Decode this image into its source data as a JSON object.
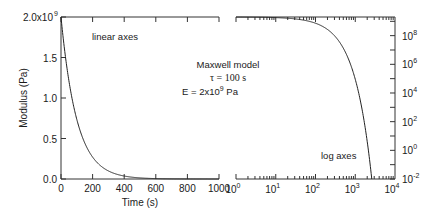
{
  "chart_data": [
    {
      "type": "line",
      "name": "linear-panel",
      "title": "",
      "xlabel": "Time (s)",
      "ylabel": "Modulus (Pa)",
      "xlim": [
        0,
        1000
      ],
      "ylim": [
        0,
        2000000000.0
      ],
      "xscale": "linear",
      "yscale": "linear",
      "x_ticks": [
        0,
        200,
        400,
        600,
        800,
        1000
      ],
      "x_tick_labels": [
        "0",
        "200",
        "400",
        "600",
        "800",
        "1000"
      ],
      "y_ticks": [
        0,
        500000000.0,
        1000000000.0,
        1500000000.0,
        2000000000.0
      ],
      "y_tick_labels": [
        "0.0",
        "0.5",
        "1.0",
        "1.5",
        "2.0x10"
      ],
      "y_top_label_exponent": "9",
      "annotation": "linear axes",
      "series": [
        {
          "name": "E(t) = E exp(-t/tau)",
          "function": "exponential_decay",
          "E": 2000000000.0,
          "tau": 100
        }
      ]
    },
    {
      "type": "line",
      "name": "log-panel",
      "xlabel": "",
      "ylabel": "",
      "xlim": [
        1,
        10000
      ],
      "ylim": [
        0.01,
        2000000000.0
      ],
      "xscale": "log",
      "yscale": "log",
      "x_ticks": [
        1,
        10,
        100,
        1000,
        10000
      ],
      "x_tick_labels": [
        {
          "base": "10",
          "exp": "0"
        },
        {
          "base": "10",
          "exp": "1"
        },
        {
          "base": "10",
          "exp": "2"
        },
        {
          "base": "10",
          "exp": "3"
        },
        {
          "base": "10",
          "exp": "4"
        }
      ],
      "y_ticks": [
        0.01,
        1,
        100,
        10000,
        1000000,
        100000000
      ],
      "y_tick_labels": [
        {
          "base": "10",
          "exp": "-2"
        },
        {
          "base": "10",
          "exp": "0"
        },
        {
          "base": "10",
          "exp": "2"
        },
        {
          "base": "10",
          "exp": "4"
        },
        {
          "base": "10",
          "exp": "6"
        },
        {
          "base": "10",
          "exp": "8"
        }
      ],
      "annotation": "log axes",
      "series": [
        {
          "name": "E(t) = E exp(-t/tau)",
          "function": "exponential_decay",
          "E": 2000000000.0,
          "tau": 100
        }
      ]
    }
  ],
  "model_box": {
    "line1": "Maxwell model",
    "line2": "τ = 100 s",
    "line3_prefix": "E = 2x10",
    "line3_exp": "9",
    "line3_suffix": " Pa"
  }
}
